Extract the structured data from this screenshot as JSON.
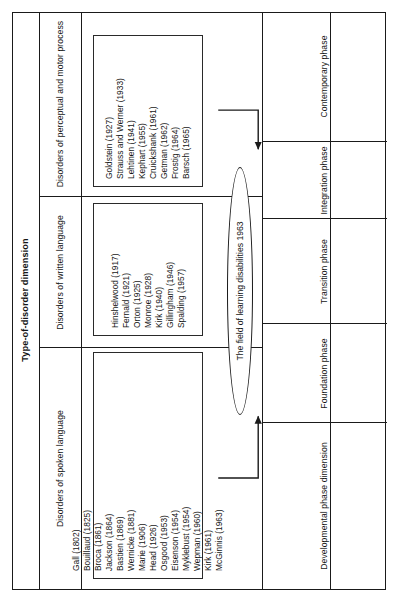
{
  "figure": {
    "header_top": "Type-of-disorder dimension",
    "header_bottom": "Developmental phase dimension",
    "center_label": "The field of learning disabilities 1963",
    "colors": {
      "line": "#1a1a1a",
      "text": "#151515",
      "background": "#ffffff"
    },
    "disorder_columns": [
      {
        "label": "Disorders of spoken language"
      },
      {
        "label": "Disorders of written language"
      },
      {
        "label": "Disorders of perceptual and motor process"
      }
    ],
    "phases": [
      {
        "label": "Foundation phase"
      },
      {
        "label": "Transition phase"
      },
      {
        "label": "Integration phase"
      },
      {
        "label": "Contemporary phase"
      }
    ],
    "spoken_language_names": [
      "Gall (1802)",
      "Bouillaud (1825)",
      "Broca (1861)",
      "Jackson (1864)",
      "Bastien (1869)",
      "Wernicke (1881)",
      "Marie (1906)",
      "Head (1926)",
      "Osgood (1953)",
      "Eisenson (1954)",
      "Myklebust (1954)",
      "Wepman (1960)",
      "Kirk (1961)",
      "McGinnis (1963)"
    ],
    "written_language_names": [
      "Hinshelwood (1917)",
      "Fernald (1921)",
      "Orton (1925)",
      "Monroe (1928)",
      "Kirk (1940)",
      "Gillingham (1946)",
      "Spalding (1957)"
    ],
    "perceptual_motor_names": [
      "Goldstein (1927)",
      "Strauss and Werner (1933)",
      "Lehtinen (1941)",
      "Kephart (1955)",
      "Cruickshank (1961)",
      "Getman (1962)",
      "Frostig (1964)",
      "Barsch (1965)"
    ]
  }
}
